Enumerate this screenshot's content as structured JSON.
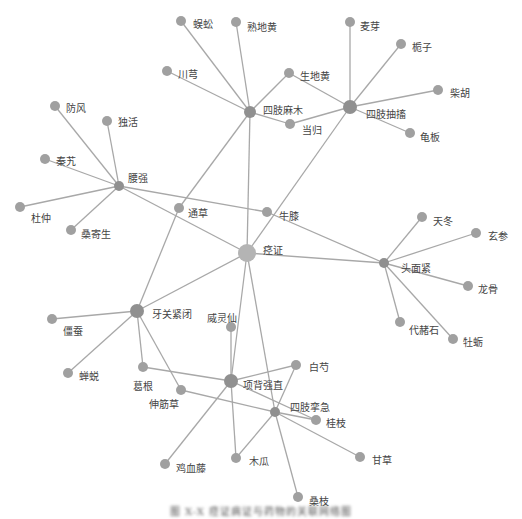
{
  "figure": {
    "type": "network-graph",
    "caption": "图 X-X 痉证病证与药物的关联网络图",
    "colors": {
      "edge": "#a8a8a8",
      "node": "#a0a0a0",
      "hub": "#909090",
      "center": "#b4b4b4",
      "label": "#444444"
    }
  },
  "nodes": [
    {
      "id": "jingzheng",
      "label": "痉证",
      "x": 247,
      "y": 253,
      "r": 9,
      "kind": "center",
      "lx": 263,
      "ly": 250
    },
    {
      "id": "sizhimamu",
      "label": "四肢麻木",
      "x": 250,
      "y": 112,
      "r": 6,
      "kind": "hub",
      "lx": 263,
      "ly": 110
    },
    {
      "id": "sizhichouchu",
      "label": "四肢抽搐",
      "x": 350,
      "y": 107,
      "r": 7,
      "kind": "hub",
      "lx": 366,
      "ly": 114
    },
    {
      "id": "yaoqiang",
      "label": "腰强",
      "x": 119,
      "y": 186,
      "r": 5,
      "kind": "hub",
      "lx": 128,
      "ly": 178
    },
    {
      "id": "toumianjin",
      "label": "头面紧",
      "x": 384,
      "y": 263,
      "r": 5,
      "kind": "hub",
      "lx": 401,
      "ly": 268
    },
    {
      "id": "yaguanjinbi",
      "label": "牙关紧闭",
      "x": 137,
      "y": 311,
      "r": 7,
      "kind": "hub",
      "lx": 152,
      "ly": 314
    },
    {
      "id": "xiangbeiqiangzhi",
      "label": "项背强直",
      "x": 231,
      "y": 381,
      "r": 7,
      "kind": "hub",
      "lx": 243,
      "ly": 385
    },
    {
      "id": "sizhiluanji",
      "label": "四肢挛急",
      "x": 275,
      "y": 412,
      "r": 5,
      "kind": "hub",
      "lx": 290,
      "ly": 407
    },
    {
      "id": "wugong",
      "label": "蜈蚣",
      "x": 181,
      "y": 21,
      "r": 5,
      "kind": "leaf",
      "lx": 193,
      "ly": 24
    },
    {
      "id": "shudihuang",
      "label": "熟地黄",
      "x": 236,
      "y": 22,
      "r": 5,
      "kind": "leaf",
      "lx": 247,
      "ly": 27
    },
    {
      "id": "chuanxiong",
      "label": "川芎",
      "x": 167,
      "y": 71,
      "r": 5,
      "kind": "leaf",
      "lx": 178,
      "ly": 74
    },
    {
      "id": "shengdihuang",
      "label": "生地黄",
      "x": 289,
      "y": 73,
      "r": 5,
      "kind": "leaf",
      "lx": 300,
      "ly": 76
    },
    {
      "id": "danggui",
      "label": "当归",
      "x": 290,
      "y": 124,
      "r": 5,
      "kind": "leaf",
      "lx": 302,
      "ly": 130
    },
    {
      "id": "maiya",
      "label": "麦芽",
      "x": 350,
      "y": 22,
      "r": 5,
      "kind": "leaf",
      "lx": 360,
      "ly": 26
    },
    {
      "id": "zhizi",
      "label": "栀子",
      "x": 401,
      "y": 44,
      "r": 5,
      "kind": "leaf",
      "lx": 412,
      "ly": 47
    },
    {
      "id": "chaihu",
      "label": "柴胡",
      "x": 438,
      "y": 90,
      "r": 5,
      "kind": "leaf",
      "lx": 450,
      "ly": 93
    },
    {
      "id": "guiban",
      "label": "龟板",
      "x": 410,
      "y": 133,
      "r": 5,
      "kind": "leaf",
      "lx": 420,
      "ly": 137
    },
    {
      "id": "fangfeng",
      "label": "防风",
      "x": 55,
      "y": 106,
      "r": 5,
      "kind": "leaf",
      "lx": 66,
      "ly": 108
    },
    {
      "id": "duhuo",
      "label": "独活",
      "x": 107,
      "y": 121,
      "r": 5,
      "kind": "leaf",
      "lx": 118,
      "ly": 122
    },
    {
      "id": "qinjiao",
      "label": "秦艽",
      "x": 45,
      "y": 159,
      "r": 5,
      "kind": "leaf",
      "lx": 56,
      "ly": 161
    },
    {
      "id": "duzhong",
      "label": "杜仲",
      "x": 20,
      "y": 207,
      "r": 5,
      "kind": "leaf",
      "lx": 31,
      "ly": 218
    },
    {
      "id": "sangjisheng",
      "label": "桑寄生",
      "x": 71,
      "y": 230,
      "r": 5,
      "kind": "leaf",
      "lx": 81,
      "ly": 234
    },
    {
      "id": "tongcao",
      "label": "通草",
      "x": 179,
      "y": 208,
      "r": 5,
      "kind": "leaf",
      "lx": 188,
      "ly": 213
    },
    {
      "id": "niuxi",
      "label": "牛膝",
      "x": 267,
      "y": 212,
      "r": 5,
      "kind": "leaf",
      "lx": 279,
      "ly": 216
    },
    {
      "id": "tiandong",
      "label": "天冬",
      "x": 422,
      "y": 217,
      "r": 5,
      "kind": "leaf",
      "lx": 433,
      "ly": 221
    },
    {
      "id": "xuanshen",
      "label": "玄参",
      "x": 476,
      "y": 233,
      "r": 5,
      "kind": "leaf",
      "lx": 488,
      "ly": 236
    },
    {
      "id": "longgu",
      "label": "龙骨",
      "x": 468,
      "y": 286,
      "r": 5,
      "kind": "leaf",
      "lx": 478,
      "ly": 289
    },
    {
      "id": "daizheshi",
      "label": "代赭石",
      "x": 400,
      "y": 322,
      "r": 5,
      "kind": "leaf",
      "lx": 409,
      "ly": 330
    },
    {
      "id": "muli",
      "label": "牡蛎",
      "x": 453,
      "y": 339,
      "r": 5,
      "kind": "leaf",
      "lx": 463,
      "ly": 342
    },
    {
      "id": "jiangcan",
      "label": "僵蚕",
      "x": 52,
      "y": 319,
      "r": 5,
      "kind": "leaf",
      "lx": 63,
      "ly": 331
    },
    {
      "id": "chantui",
      "label": "蝉蜕",
      "x": 68,
      "y": 373,
      "r": 5,
      "kind": "leaf",
      "lx": 79,
      "ly": 376
    },
    {
      "id": "gegen",
      "label": "葛根",
      "x": 143,
      "y": 367,
      "r": 5,
      "kind": "leaf",
      "lx": 133,
      "ly": 386
    },
    {
      "id": "shenjincao",
      "label": "伸筋草",
      "x": 181,
      "y": 390,
      "r": 5,
      "kind": "leaf",
      "lx": 149,
      "ly": 404
    },
    {
      "id": "weilingxian",
      "label": "威灵仙",
      "x": 231,
      "y": 327,
      "r": 5,
      "kind": "leaf",
      "lx": 207,
      "ly": 318
    },
    {
      "id": "baishao",
      "label": "白芍",
      "x": 296,
      "y": 365,
      "r": 5,
      "kind": "leaf",
      "lx": 309,
      "ly": 367
    },
    {
      "id": "guizhi",
      "label": "桂枝",
      "x": 316,
      "y": 420,
      "r": 5,
      "kind": "leaf",
      "lx": 326,
      "ly": 423
    },
    {
      "id": "gancao",
      "label": "甘草",
      "x": 360,
      "y": 457,
      "r": 5,
      "kind": "leaf",
      "lx": 372,
      "ly": 460
    },
    {
      "id": "mugua",
      "label": "木瓜",
      "x": 236,
      "y": 458,
      "r": 5,
      "kind": "leaf",
      "lx": 249,
      "ly": 461
    },
    {
      "id": "jixueteng",
      "label": "鸡血藤",
      "x": 165,
      "y": 464,
      "r": 5,
      "kind": "leaf",
      "lx": 176,
      "ly": 468
    },
    {
      "id": "sangzhi",
      "label": "桑枝",
      "x": 298,
      "y": 497,
      "r": 5,
      "kind": "leaf",
      "lx": 309,
      "ly": 501
    }
  ],
  "edges": [
    [
      "wugong",
      "sizhimamu"
    ],
    [
      "shudihuang",
      "sizhimamu"
    ],
    [
      "chuanxiong",
      "sizhimamu"
    ],
    [
      "shengdihuang",
      "sizhimamu"
    ],
    [
      "danggui",
      "sizhimamu"
    ],
    [
      "sizhimamu",
      "tongcao"
    ],
    [
      "sizhimamu",
      "jingzheng"
    ],
    [
      "maiya",
      "sizhichouchu"
    ],
    [
      "zhizi",
      "sizhichouchu"
    ],
    [
      "chaihu",
      "sizhichouchu"
    ],
    [
      "guiban",
      "sizhichouchu"
    ],
    [
      "shengdihuang",
      "sizhichouchu"
    ],
    [
      "danggui",
      "sizhichouchu"
    ],
    [
      "sizhichouchu",
      "jingzheng"
    ],
    [
      "fangfeng",
      "yaoqiang"
    ],
    [
      "duhuo",
      "yaoqiang"
    ],
    [
      "qinjiao",
      "yaoqiang"
    ],
    [
      "duzhong",
      "yaoqiang"
    ],
    [
      "sangjisheng",
      "yaoqiang"
    ],
    [
      "yaoqiang",
      "niuxi"
    ],
    [
      "yaoqiang",
      "jingzheng"
    ],
    [
      "niuxi",
      "toumianjin"
    ],
    [
      "tiandong",
      "toumianjin"
    ],
    [
      "xuanshen",
      "toumianjin"
    ],
    [
      "longgu",
      "toumianjin"
    ],
    [
      "daizheshi",
      "toumianjin"
    ],
    [
      "muli",
      "toumianjin"
    ],
    [
      "jingzheng",
      "toumianjin"
    ],
    [
      "jingzheng",
      "yaguanjinbi"
    ],
    [
      "tongcao",
      "yaguanjinbi"
    ],
    [
      "jiangcan",
      "yaguanjinbi"
    ],
    [
      "chantui",
      "yaguanjinbi"
    ],
    [
      "gegen",
      "yaguanjinbi"
    ],
    [
      "shenjincao",
      "yaguanjinbi"
    ],
    [
      "jingzheng",
      "xiangbeiqiangzhi"
    ],
    [
      "weilingxian",
      "xiangbeiqiangzhi"
    ],
    [
      "gegen",
      "xiangbeiqiangzhi"
    ],
    [
      "baishao",
      "xiangbeiqiangzhi"
    ],
    [
      "guizhi",
      "xiangbeiqiangzhi"
    ],
    [
      "mugua",
      "xiangbeiqiangzhi"
    ],
    [
      "jixueteng",
      "xiangbeiqiangzhi"
    ],
    [
      "jingzheng",
      "sizhiluanji"
    ],
    [
      "shenjincao",
      "sizhiluanji"
    ],
    [
      "baishao",
      "sizhiluanji"
    ],
    [
      "guizhi",
      "sizhiluanji"
    ],
    [
      "gancao",
      "sizhiluanji"
    ],
    [
      "mugua",
      "sizhiluanji"
    ],
    [
      "sangzhi",
      "sizhiluanji"
    ]
  ]
}
